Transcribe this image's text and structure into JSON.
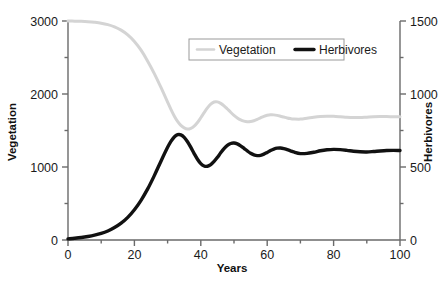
{
  "chart_data": {
    "type": "line",
    "title": "",
    "xlabel": "Years",
    "ylabel": "Vegetation",
    "y2label": "Herbivores",
    "xlim": [
      0,
      100
    ],
    "ylim": [
      0,
      3000
    ],
    "y2lim": [
      0,
      1500
    ],
    "grid": false,
    "legend_position": "top-center",
    "xticks": [
      0,
      20,
      40,
      60,
      80,
      100
    ],
    "xtick_labels": [
      "0",
      "20",
      "40",
      "60",
      "80",
      "100"
    ],
    "xminor_step": 10,
    "yticks": [
      0,
      1000,
      2000,
      3000
    ],
    "ytick_labels": [
      "0",
      "1000",
      "2000",
      "3000"
    ],
    "yminor_step": 500,
    "y2ticks": [
      0,
      500,
      1000,
      1500
    ],
    "y2tick_labels": [
      "0",
      "500",
      "1000",
      "1500"
    ],
    "y2minor_step": 250,
    "series": [
      {
        "name": "Vegetation",
        "axis": "left",
        "color": "#d4d4d4",
        "width": 3.0,
        "x": [
          0,
          2,
          4,
          6,
          8,
          10,
          12,
          14,
          16,
          18,
          20,
          22,
          24,
          26,
          28,
          30,
          31,
          32,
          33,
          34,
          35,
          36,
          37,
          38,
          39,
          40,
          41,
          42,
          43,
          44,
          45,
          46,
          47,
          48,
          49,
          50,
          51,
          52,
          53,
          54,
          55,
          56,
          57,
          58,
          59,
          60,
          61,
          62,
          63,
          64,
          65,
          66,
          67,
          68,
          70,
          72,
          74,
          76,
          78,
          80,
          82,
          84,
          86,
          88,
          90,
          92,
          94,
          96,
          98,
          100
        ],
        "y": [
          3000,
          2998,
          2995,
          2990,
          2982,
          2970,
          2950,
          2920,
          2875,
          2810,
          2720,
          2600,
          2450,
          2280,
          2090,
          1890,
          1790,
          1700,
          1625,
          1570,
          1535,
          1520,
          1530,
          1560,
          1610,
          1675,
          1745,
          1810,
          1862,
          1890,
          1892,
          1872,
          1838,
          1795,
          1750,
          1708,
          1672,
          1645,
          1628,
          1620,
          1622,
          1634,
          1652,
          1674,
          1694,
          1708,
          1715,
          1714,
          1707,
          1696,
          1684,
          1672,
          1663,
          1658,
          1656,
          1668,
          1682,
          1692,
          1696,
          1694,
          1688,
          1681,
          1677,
          1678,
          1683,
          1688,
          1691,
          1691,
          1689,
          1688
        ]
      },
      {
        "name": "Herbivores",
        "axis": "right",
        "color": "#111111",
        "width": 3.4,
        "x": [
          0,
          2,
          4,
          6,
          8,
          10,
          12,
          14,
          16,
          18,
          20,
          22,
          24,
          26,
          28,
          30,
          31,
          32,
          33,
          34,
          35,
          36,
          37,
          38,
          39,
          40,
          41,
          42,
          43,
          44,
          45,
          46,
          47,
          48,
          49,
          50,
          51,
          52,
          53,
          54,
          55,
          56,
          57,
          58,
          59,
          60,
          61,
          62,
          63,
          64,
          65,
          66,
          67,
          68,
          70,
          72,
          74,
          76,
          78,
          80,
          82,
          84,
          86,
          88,
          90,
          92,
          94,
          96,
          98,
          100
        ],
        "y": [
          8,
          12,
          17,
          24,
          33,
          45,
          62,
          85,
          115,
          155,
          207,
          272,
          350,
          441,
          540,
          635,
          676,
          706,
          721,
          720,
          703,
          673,
          634,
          592,
          553,
          523,
          507,
          505,
          516,
          538,
          566,
          597,
          626,
          648,
          661,
          664,
          658,
          645,
          628,
          610,
          594,
          583,
          578,
          580,
          588,
          600,
          613,
          623,
          629,
          630,
          626,
          619,
          611,
          603,
          592,
          593,
          601,
          611,
          618,
          621,
          619,
          614,
          608,
          604,
          603,
          606,
          610,
          613,
          614,
          613
        ]
      }
    ]
  },
  "legend": {
    "items": [
      {
        "label": "Vegetation",
        "color": "#d4d4d4"
      },
      {
        "label": "Herbivores",
        "color": "#111111"
      }
    ]
  },
  "axes": {
    "x_title": "Years",
    "y_left_title": "Vegetation",
    "y_right_title": "Herbivores",
    "axis_color": "#6a6a6a"
  }
}
